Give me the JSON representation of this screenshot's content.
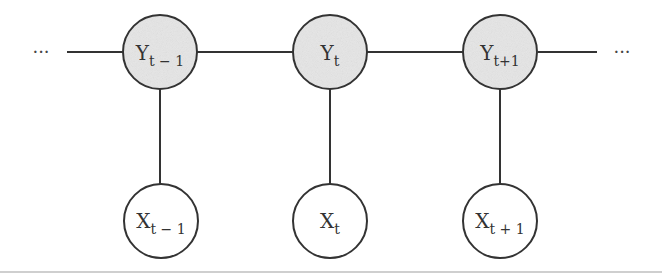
{
  "diagram": {
    "type": "hidden-markov-model / linear-chain graphical model",
    "colors": {
      "edge": "#333333",
      "hidden_fill": "#e6e6e6",
      "observed_fill": "#ffffff",
      "border_line": "#cfcfcf"
    },
    "ellipsis_left": "···",
    "ellipsis_right": "···",
    "hidden_nodes": [
      {
        "id": "y_prev",
        "base": "Y",
        "sub": "t − 1",
        "cx": 160,
        "cy": 52
      },
      {
        "id": "y_curr",
        "base": "Y",
        "sub": "t",
        "cx": 330,
        "cy": 52
      },
      {
        "id": "y_next",
        "base": "Y",
        "sub": "t+1",
        "cx": 500,
        "cy": 52
      }
    ],
    "observed_nodes": [
      {
        "id": "x_prev",
        "base": "X",
        "sub": "t − 1",
        "cx": 161,
        "cy": 221
      },
      {
        "id": "x_curr",
        "base": "X",
        "sub": "t",
        "cx": 330,
        "cy": 221
      },
      {
        "id": "x_next",
        "base": "X",
        "sub": "t + 1",
        "cx": 500,
        "cy": 221
      }
    ],
    "edges": [
      {
        "from": "ellipsis_left",
        "to": "y_prev"
      },
      {
        "from": "y_prev",
        "to": "y_curr"
      },
      {
        "from": "y_curr",
        "to": "y_next"
      },
      {
        "from": "y_next",
        "to": "ellipsis_right"
      },
      {
        "from": "y_prev",
        "to": "x_prev"
      },
      {
        "from": "y_curr",
        "to": "x_curr"
      },
      {
        "from": "y_next",
        "to": "x_next"
      }
    ]
  }
}
